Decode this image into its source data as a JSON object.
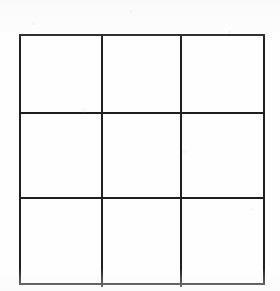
{
  "figure": {
    "name": "3x3 grid",
    "type": "grid",
    "rows": 3,
    "columns": 3,
    "cell_count": 9,
    "line_color": "#1f1f1f",
    "line_width_px": 2,
    "background_color": "#fefefe",
    "bounds": {
      "left": 19,
      "top": 34,
      "width": 246,
      "height": 251
    },
    "vertical_dividers_x": [
      102,
      183
    ],
    "horizontal_dividers_y": [
      112,
      197
    ],
    "column_widths_px": [
      83,
      81,
      82
    ],
    "row_heights_px": [
      78,
      85,
      88
    ],
    "cells": [
      {
        "row": 1,
        "col": 1,
        "label": ""
      },
      {
        "row": 1,
        "col": 2,
        "label": ""
      },
      {
        "row": 1,
        "col": 3,
        "label": ""
      },
      {
        "row": 2,
        "col": 1,
        "label": ""
      },
      {
        "row": 2,
        "col": 2,
        "label": ""
      },
      {
        "row": 2,
        "col": 3,
        "label": ""
      },
      {
        "row": 3,
        "col": 1,
        "label": ""
      },
      {
        "row": 3,
        "col": 2,
        "label": ""
      },
      {
        "row": 3,
        "col": 3,
        "label": ""
      }
    ]
  }
}
